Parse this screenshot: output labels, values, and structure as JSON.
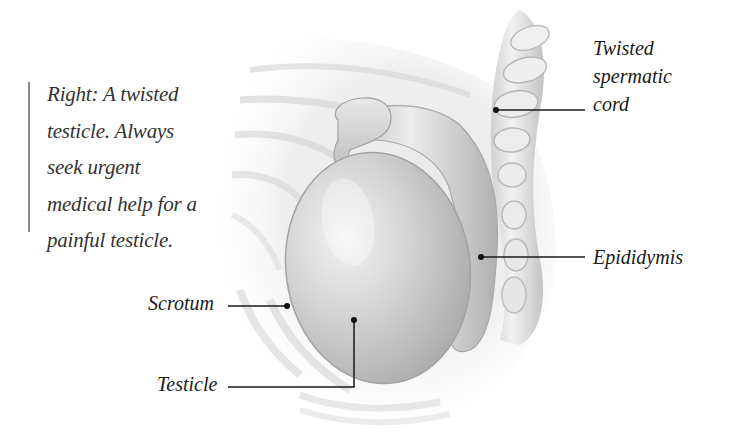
{
  "caption": {
    "lines": [
      "Right: A twisted",
      "testicle. Always",
      "seek urgent",
      "medical help for a",
      "painful testicle."
    ]
  },
  "labels": {
    "cord": {
      "lines": [
        "Twisted",
        "spermatic",
        "cord"
      ]
    },
    "epididymis": "Epididymis",
    "scrotum": "Scrotum",
    "testicle": "Testicle"
  },
  "colors": {
    "background": "#ffffff",
    "text": "#1a1a1a",
    "caption_text": "#333333",
    "leader_line": "#1a1a1a",
    "caption_rule": "#8a8a8a",
    "illustration_gray": "#bdbdbd"
  }
}
